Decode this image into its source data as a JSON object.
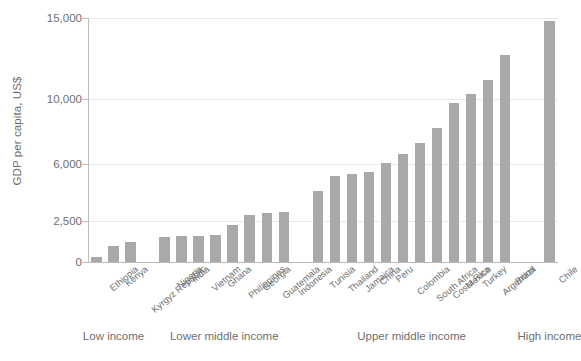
{
  "chart_data": {
    "type": "bar",
    "title": "",
    "subtitle": "",
    "xlabel": "",
    "ylabel": "GDP per capita, US$",
    "ylim": [
      0,
      15000
    ],
    "grid": true,
    "legend": "none",
    "bar_color": "#a9a9a9",
    "axis_color": "#bdbdbd",
    "grid_color": "#e9e9e9",
    "text_color": "#6f6f6f",
    "yticks": [
      0,
      2500,
      6000,
      10000,
      15000
    ],
    "ytick_labels": [
      "0",
      "2,500",
      "6,000",
      "10,000",
      "15,000"
    ],
    "categories": [
      "Ethiopia",
      "Kenya",
      "Kyrgyz Republic",
      "Nigeria",
      "India",
      "Vietnam",
      "Ghana",
      "Philippines",
      "Georgia",
      "Guatemala",
      "Indonesia",
      "Tunisia",
      "Thailand",
      "Jamaica",
      "China",
      "Peru",
      "Colombia",
      "South Africa",
      "Costa Rica",
      "Mexico",
      "Turkey",
      "Argentina",
      "Brazil",
      "Chile"
    ],
    "values": [
      300,
      1000,
      1250,
      1550,
      1600,
      1600,
      1650,
      2250,
      2900,
      3000,
      3050,
      4350,
      5300,
      5400,
      5550,
      6100,
      6650,
      7300,
      8250,
      9800,
      10350,
      11200,
      12700,
      14800
    ],
    "groups": [
      {
        "label": "Low income",
        "start": 0,
        "count": 3
      },
      {
        "label": "Lower middle income",
        "start": 3,
        "count": 8
      },
      {
        "label": "Upper middle income",
        "start": 11,
        "count": 12
      },
      {
        "label": "High income",
        "start": 23,
        "count": 1
      }
    ],
    "group_gaps": [
      {
        "after_index": 2,
        "gap_slots": 1
      },
      {
        "after_index": 10,
        "gap_slots": 1
      },
      {
        "after_index": 22,
        "gap_slots": 1.6
      }
    ]
  }
}
